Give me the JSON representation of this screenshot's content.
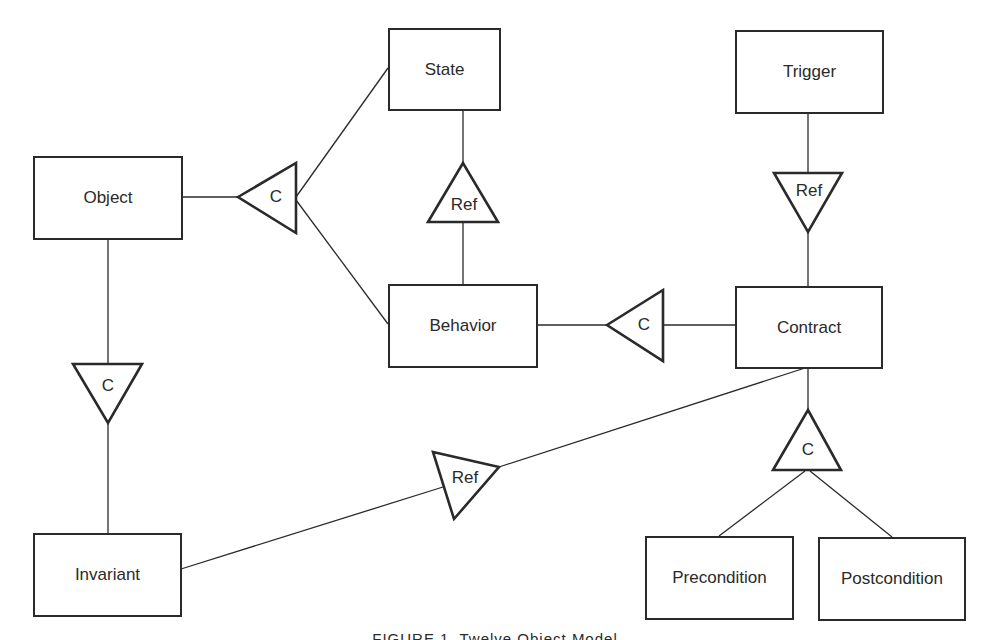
{
  "diagram": {
    "caption": "FIGURE 1. Twelve Object Model",
    "line_color": "#2a2a2a",
    "entities": [
      {
        "id": "state",
        "label": "State"
      },
      {
        "id": "trigger",
        "label": "Trigger"
      },
      {
        "id": "object",
        "label": "Object"
      },
      {
        "id": "behavior",
        "label": "Behavior"
      },
      {
        "id": "contract",
        "label": "Contract"
      },
      {
        "id": "invariant",
        "label": "Invariant"
      },
      {
        "id": "precondition",
        "label": "Precondition"
      },
      {
        "id": "postcondition",
        "label": "Postcondition"
      }
    ],
    "relationships": [
      {
        "id": "object-composition",
        "label": "C",
        "type": "composition",
        "from": "Object",
        "to": [
          "State",
          "Behavior"
        ]
      },
      {
        "id": "state-behavior-ref",
        "label": "Ref",
        "type": "reference",
        "from": "Behavior",
        "to": [
          "State"
        ]
      },
      {
        "id": "trigger-contract-ref",
        "label": "Ref",
        "type": "reference",
        "from": "Trigger",
        "to": [
          "Contract"
        ]
      },
      {
        "id": "behavior-contract-composition",
        "label": "C",
        "type": "composition",
        "from": "Behavior",
        "to": [
          "Contract"
        ]
      },
      {
        "id": "object-invariant-composition",
        "label": "C",
        "type": "composition",
        "from": "Object",
        "to": [
          "Invariant"
        ]
      },
      {
        "id": "invariant-contract-ref",
        "label": "Ref",
        "type": "reference",
        "from": "Invariant",
        "to": [
          "Contract"
        ]
      },
      {
        "id": "contract-conditions-composition",
        "label": "C",
        "type": "composition",
        "from": "Contract",
        "to": [
          "Precondition",
          "Postcondition"
        ]
      }
    ]
  }
}
